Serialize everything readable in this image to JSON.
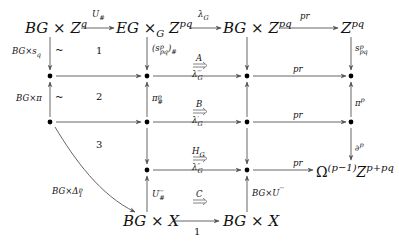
{
  "diagram": {
    "type": "commutative-diagram",
    "nodes": {
      "top_left": "BG × Z^q",
      "top_mid": "EG ×_G Z^pq",
      "top_mid2": "BG × Z^pq",
      "top_right": "Z^pq",
      "right_bottom": "Ω^(p−1) Z^(p+pq)",
      "bottom_left": "BG × X",
      "bottom_right": "BG × X"
    },
    "arrows": {
      "top_1": "U_#",
      "top_2": "λ_G",
      "top_3": "pr",
      "row1_pr": "pr",
      "row2_pr": "pr",
      "row3_pr": "pr",
      "bottom": "1",
      "left_1": "BG×s_q",
      "left_2": "BG×π",
      "left_curve": "BG×Δ_1^p",
      "mid_1": "(s^p_pq)_#",
      "mid_2": "π^p_#",
      "mid_4": "U'''_#",
      "col3_4": "BG×U'''",
      "right_1": "s^p_pq",
      "right_2": "π^p",
      "right_3": "∂^p"
    },
    "cells": {
      "cell_1": "1",
      "cell_2": "2",
      "cell_3": "3",
      "tilde_1": "~",
      "tilde_2": "~"
    },
    "two_cells": [
      {
        "top": "A",
        "bottom": "λ'''_G"
      },
      {
        "top": "B",
        "bottom": "λ'_G"
      },
      {
        "top": "H_G",
        "bottom": "λ''_G"
      },
      {
        "top": "C",
        "bottom": ""
      }
    ],
    "labels": {
      "top_left_base": "BG × Z",
      "top_left_sup": "q",
      "top_mid_base": "EG ×",
      "top_mid_sub": "G",
      "top_mid_z": "Z",
      "top_mid_sup": "pq",
      "top_mid2_base": "BG × Z",
      "top_mid2_sup": "pq",
      "top_right_base": "Z",
      "top_right_sup": "pq",
      "omega": "Ω",
      "omega_sup": "(p−1)",
      "omega_z": "Z",
      "omega_z_sup": "p+pq",
      "bl": "BG × X",
      "br": "BG × X",
      "u_hash_base": "U",
      "u_hash_sub": "#",
      "lambda_base": "λ",
      "lambda_sub": "G",
      "pr": "pr",
      "one": "1",
      "bgxs_base": "BG×s",
      "bgxs_sub": "q",
      "bgxpi": "BG×π",
      "bgxdelta_base": "BG×Δ",
      "bgxdelta_sup": "p",
      "bgxdelta_sub": "1",
      "s_hash_open": "(s",
      "s_hash_sup": "p",
      "s_hash_sub": "pq",
      "s_hash_close": ")",
      "s_hash_hash": "#",
      "pi_hash_base": "π",
      "pi_hash_sup": "p",
      "pi_hash_sub": "#",
      "u3_base": "U",
      "u3_sup": "′′′",
      "u3_sub": "#",
      "bgxu3_base": "BG×U",
      "bgxu3_sup": "′′′",
      "s_right_base": "s",
      "s_right_sup": "p",
      "s_right_sub": "pq",
      "pi_right_base": "π",
      "pi_right_sup": "p",
      "del_base": "∂",
      "del_sup": "p",
      "A": "A",
      "B": "B",
      "HG_base": "H",
      "HG_sub": "G",
      "C": "C",
      "l3_base": "λ",
      "l3_sup": "′′′",
      "l3_sub": "G",
      "l1_base": "λ",
      "l1_sup": "′",
      "l1_sub": "G",
      "l2_base": "λ",
      "l2_sup": "′′",
      "l2_sub": "G",
      "tilde": "~",
      "c1": "1",
      "c2": "2",
      "c3": "3"
    },
    "colors": {
      "arrow": "#555555",
      "dot": "#000000",
      "text": "#111111"
    }
  }
}
